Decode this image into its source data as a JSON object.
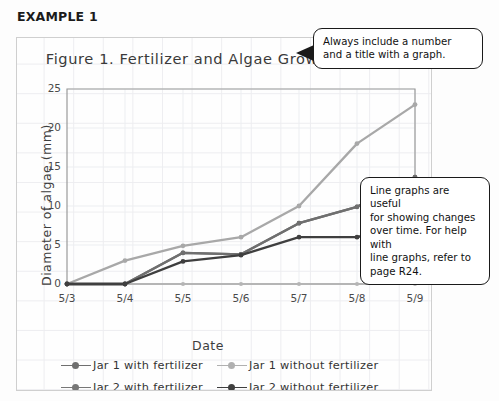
{
  "heading": "EXAMPLE 1",
  "chart_data": {
    "type": "line",
    "title": "Figure 1. Fertilizer and Algae Growth",
    "xlabel": "Date",
    "ylabel": "Diameter of algae (mm)",
    "categories": [
      "5/3",
      "5/4",
      "5/5",
      "5/6",
      "5/7",
      "5/8",
      "5/9"
    ],
    "ylim": [
      0,
      25
    ],
    "yticks": [
      0,
      5,
      10,
      15,
      20,
      25
    ],
    "grid": true,
    "legend_position": "bottom",
    "series": [
      {
        "name": "Jar 1 with fertilizer",
        "color": "#6f6f6f",
        "values": [
          0,
          0,
          4,
          3.8,
          7.8,
          9.9,
          13.7
        ]
      },
      {
        "name": "Jar 1 without fertilizer",
        "color": "#a8a8a8",
        "values": [
          0,
          3,
          4.9,
          6,
          10,
          18,
          23
        ]
      },
      {
        "name": "Jar 2 with fertilizer",
        "color": "#6f6f6f",
        "values": [
          0,
          0,
          4,
          3.8,
          7.8,
          9.9,
          13.7
        ]
      },
      {
        "name": "Jar 2 without fertilizer",
        "color": "#3f3f3f",
        "values": [
          0,
          0,
          2.9,
          3.7,
          6,
          6,
          8
        ]
      }
    ],
    "baseline_series": {
      "name": "baseline-zero-line",
      "color": "#b5b5b5",
      "values": [
        0,
        0,
        0,
        0,
        0,
        0,
        0
      ]
    }
  },
  "legend": [
    {
      "label": "Jar 1 with fertilizer",
      "color": "#6f6f6f"
    },
    {
      "label": "Jar 1 without fertilizer",
      "color": "#b0b0b0"
    },
    {
      "label": "Jar 2 with fertilizer",
      "color": "#777777"
    },
    {
      "label": "Jar 2 without fertilizer",
      "color": "#3f3f3f"
    }
  ],
  "callouts": {
    "title_note": {
      "line1": "Always include a number",
      "line2": "and a title with a graph."
    },
    "linegraph_note": {
      "line1": "Line graphs are useful",
      "line2": "for showing changes",
      "line3": "over time. For help with",
      "line4": "line graphs, refer to",
      "line5": "page R24."
    }
  }
}
